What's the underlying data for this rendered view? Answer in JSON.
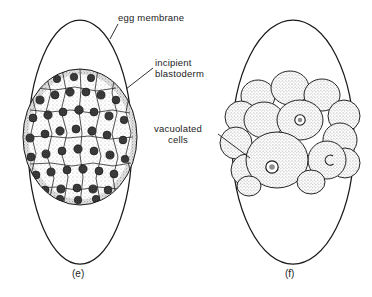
{
  "figure": {
    "domain_note": "biology textbook line illustration",
    "background_color": "#ffffff",
    "ink_color": "#1a1a1a",
    "labels": {
      "egg_membrane": "egg  membrane",
      "incipient_line1": "incipient",
      "incipient_line2": "blastoderm",
      "vacuolated_line1": "vacuolated",
      "vacuolated_line2": "cells"
    },
    "captions": {
      "panel_e": "(e)",
      "panel_f": "(f)"
    },
    "bottom_cut_text": "",
    "panels": [
      {
        "id": "e",
        "caption": "(e)",
        "membrane": {
          "cx": 80,
          "cy": 142,
          "rx": 52,
          "ry": 122
        },
        "content_description": "incipient blastoderm: dense mass of small polygonal cells each with a dark stippled nucleus",
        "cell_count_approx": 58,
        "mass": {
          "cx": 80,
          "cy": 137,
          "rx": 57,
          "ry": 68
        }
      },
      {
        "id": "f",
        "caption": "(f)",
        "membrane": {
          "cx": 293,
          "cy": 142,
          "rx": 61,
          "ry": 122
        },
        "content_description": "vacuolated cells: cluster of large rounded stippled blastomeres, several showing a ring-shaped vacuole",
        "cell_count_approx": 16,
        "mass": {
          "cx": 293,
          "cy": 130,
          "rx": 68,
          "ry": 62
        }
      }
    ],
    "leaders": [
      {
        "name": "egg-membrane-leader",
        "from": [
          118,
          24
        ],
        "to": [
          110,
          39
        ]
      },
      {
        "name": "incipient-blastoderm-leader",
        "from": [
          153,
          68
        ],
        "to": [
          126,
          89
        ]
      },
      {
        "name": "vacuolated-cells-leader",
        "from": [
          218,
          134
        ],
        "to": [
          250,
          158
        ]
      }
    ]
  }
}
